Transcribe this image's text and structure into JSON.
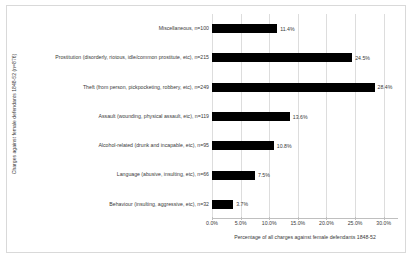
{
  "chart_data": {
    "type": "bar",
    "orientation": "horizontal",
    "title": "",
    "xlabel": "Percentage of all charges against female defendants 1848-52",
    "ylabel": "Charges against female defendants 1848-52 (n=876)",
    "categories": [
      "Miscellaneous, n=100",
      "Prostitution (disorderly, riotous, idle/common prostitute, etc), n=215",
      "Theft (from person, pickpocketing, robbery, etc), n=249",
      "Assault (wounding, physical assault, etc), n=119",
      "Alcohol-related (drunk and incapable, etc), n=95",
      "Language (abusive, insulting, etc), n=66",
      "Behaviour (insulting, aggressive, etc), n=32"
    ],
    "values": [
      11.4,
      24.5,
      28.4,
      13.6,
      10.8,
      7.5,
      3.7
    ],
    "data_labels": [
      "11.4%",
      "24.5%",
      "28.4%",
      "13.6%",
      "10.8%",
      "7.5%",
      "3.7%"
    ],
    "counts": [
      100,
      215,
      249,
      119,
      95,
      66,
      32
    ],
    "total": 876,
    "xlim": [
      0,
      32.5
    ],
    "xticks": [
      0,
      5,
      10,
      15,
      20,
      25,
      30
    ],
    "xtick_labels": [
      "0.0%",
      "5.0%",
      "10.0%",
      "15.0%",
      "20.0%",
      "25.0%",
      "30.0%"
    ],
    "grid": true,
    "legend": "none",
    "bar_color": "#000000",
    "grid_color": "#dddddd",
    "text_color": "#3a3a3a"
  }
}
